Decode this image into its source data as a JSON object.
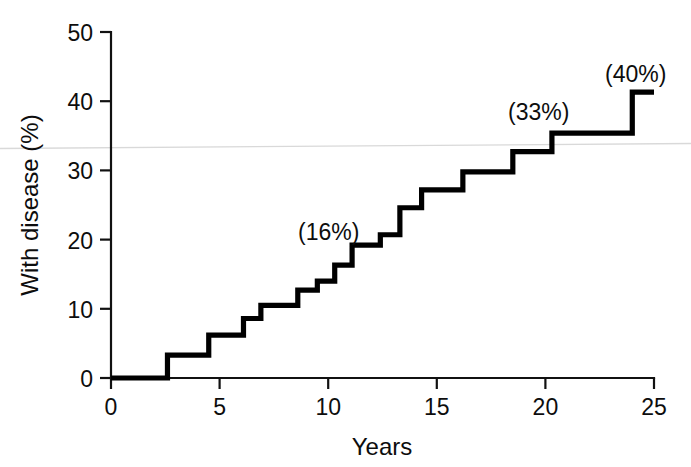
{
  "chart_data": {
    "type": "line",
    "subtype": "step-cumulative-incidence",
    "title": "",
    "xlabel": "Years",
    "ylabel": "With disease (%)",
    "xlim": [
      0,
      25
    ],
    "ylim": [
      0,
      50
    ],
    "xticks": [
      0,
      5,
      10,
      15,
      20,
      25
    ],
    "yticks": [
      0,
      10,
      20,
      30,
      40,
      50
    ],
    "xtick_labels": [
      "0",
      "5",
      "10",
      "15",
      "20",
      "25"
    ],
    "ytick_labels": [
      "0",
      "10",
      "20",
      "30",
      "40",
      "50"
    ],
    "grid": false,
    "legend": null,
    "legend_position": "none",
    "series": [
      {
        "name": "Cumulative incidence",
        "step_type": "post",
        "color": "#000000",
        "x": [
          0,
          2.6,
          2.6,
          4.5,
          4.5,
          6.1,
          6.1,
          6.9,
          6.9,
          8.6,
          8.6,
          9.5,
          9.5,
          10.3,
          10.3,
          11.1,
          11.1,
          12.4,
          12.4,
          13.3,
          13.3,
          14.3,
          14.3,
          16.2,
          16.2,
          18.5,
          18.5,
          20.3,
          20.3,
          24.0,
          24.0,
          25.0
        ],
        "y": [
          0,
          0,
          3.3,
          3.3,
          6.2,
          6.2,
          8.6,
          8.6,
          10.5,
          10.5,
          12.7,
          12.7,
          14.0,
          14.0,
          16.3,
          16.3,
          19.2,
          19.2,
          20.7,
          20.7,
          24.6,
          24.6,
          27.2,
          27.2,
          29.8,
          29.8,
          32.7,
          32.7,
          35.4,
          35.4,
          41.3,
          41.3
        ]
      }
    ],
    "annotations": [
      {
        "text": "(16%)",
        "x_value": 10.3,
        "y_value": 16.3,
        "x_px": 298,
        "y_px": 240
      },
      {
        "text": "(33%)",
        "x_value": 18.5,
        "y_value": 32.7,
        "x_px": 508,
        "y_px": 120
      },
      {
        "text": "(40%)",
        "x_value": 24.0,
        "y_value": 41.3,
        "x_px": 605,
        "y_px": 82
      }
    ]
  },
  "axes": {
    "y_axis_name": "y-axis",
    "x_axis_name": "x-axis",
    "y_title": "With disease (%)",
    "x_title": "Years"
  }
}
